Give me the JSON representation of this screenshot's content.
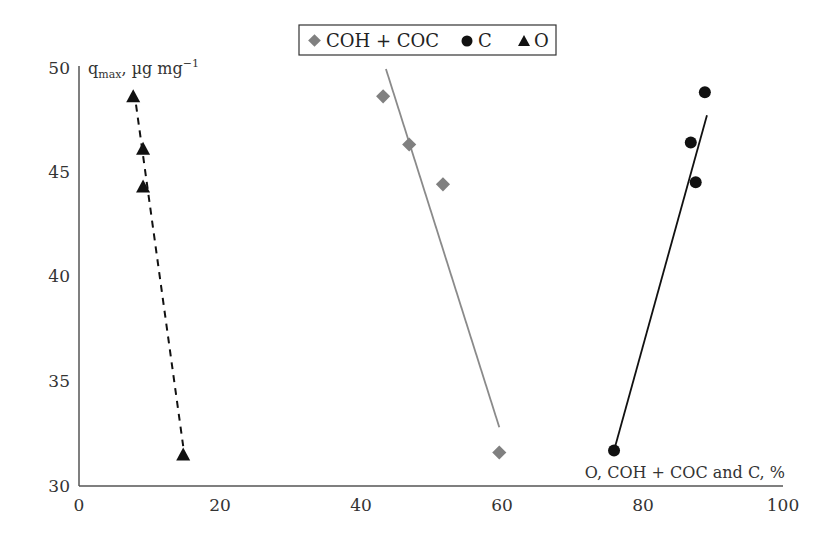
{
  "chart_data": {
    "type": "scatter",
    "title": "",
    "xlabel": "O, COH + COC and C, %",
    "ylabel": "q_max, µg mg⁻¹",
    "xlim": [
      0,
      100
    ],
    "ylim": [
      30,
      50
    ],
    "xticks": [
      0,
      20,
      40,
      60,
      80,
      100
    ],
    "yticks": [
      30,
      35,
      40,
      45,
      50
    ],
    "grid": false,
    "legend_position": "top-center",
    "series": [
      {
        "name": "COH + COC",
        "marker": "diamond",
        "color": "#808080",
        "trendline": "solid-gray",
        "points": [
          [
            43.2,
            48.6
          ],
          [
            46.9,
            46.3
          ],
          [
            51.7,
            44.4
          ],
          [
            59.7,
            31.6
          ]
        ]
      },
      {
        "name": "C",
        "marker": "circle",
        "color": "#111111",
        "trendline": "solid-black",
        "points": [
          [
            76.0,
            31.7
          ],
          [
            86.9,
            46.4
          ],
          [
            87.6,
            44.5
          ],
          [
            88.9,
            48.8
          ]
        ]
      },
      {
        "name": "O",
        "marker": "triangle",
        "color": "#111111",
        "trendline": "dashed-black",
        "points": [
          [
            7.7,
            48.6
          ],
          [
            9.1,
            46.1
          ],
          [
            9.1,
            44.3
          ],
          [
            14.8,
            31.5
          ]
        ]
      }
    ],
    "trendlines": [
      {
        "series": "COH + COC",
        "from": [
          43.6,
          49.9
        ],
        "to": [
          59.7,
          32.8
        ]
      },
      {
        "series": "C",
        "from": [
          76.0,
          31.7
        ],
        "to": [
          89.2,
          47.7
        ]
      },
      {
        "series": "O",
        "from": [
          8.1,
          48.2
        ],
        "to": [
          14.8,
          31.9
        ]
      }
    ]
  },
  "legend": {
    "items": [
      {
        "label": "COH + COC"
      },
      {
        "label": "C"
      },
      {
        "label": "O"
      }
    ]
  },
  "axes": {
    "y_label_main": "q",
    "y_label_sub": "max",
    "y_label_rest": ", µg mg",
    "y_label_sup": "−1",
    "x_label": "O, COH + COC and C, %",
    "x_ticks": [
      "0",
      "20",
      "40",
      "60",
      "80",
      "100"
    ],
    "y_ticks": [
      "30",
      "35",
      "40",
      "45",
      "50"
    ]
  }
}
